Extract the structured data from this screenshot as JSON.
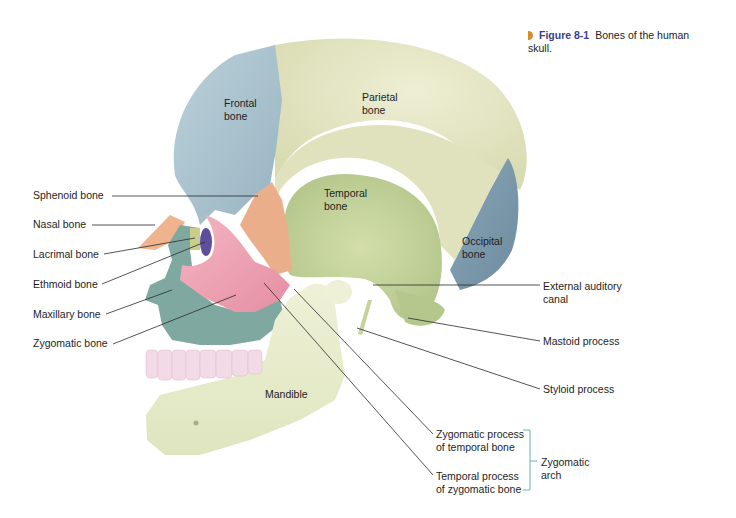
{
  "caption": {
    "figure_number": "Figure 8-1",
    "title_line1": "Bones of the human",
    "title_line2": "skull."
  },
  "colors": {
    "frontal": "#a9c3cf",
    "parietal": "#e4e5c4",
    "temporal": "#c9d7a0",
    "occipital": "#7f9cae",
    "sphenoid": "#eab08e",
    "nasal": "#efb48e",
    "zygomatic": "#ee9fb0",
    "maxillary": "#7fa9a0",
    "mandible": "#e7eccb",
    "teeth": "#f2dbe6",
    "lacrimal": "#c9cf8a",
    "ethmoid": "#6a5aa8",
    "caption_accent": "#d98a2b",
    "caption_text": "#3a3f8f"
  },
  "labels": {
    "frontal": [
      "Frontal",
      "bone"
    ],
    "parietal": [
      "Parietal",
      "bone"
    ],
    "temporal": [
      "Temporal",
      "bone"
    ],
    "occipital": [
      "Occipital",
      "bone"
    ],
    "mandible": "Mandible",
    "sphenoid": "Sphenoid bone",
    "nasal": "Nasal bone",
    "lacrimal": "Lacrimal bone",
    "ethmoid": "Ethmoid bone",
    "maxillary": "Maxillary bone",
    "zygomatic": "Zygomatic bone",
    "external_auditory": [
      "External auditory",
      "canal"
    ],
    "mastoid": "Mastoid process",
    "styloid": "Styloid process",
    "zyg_process_temporal": [
      "Zygomatic process",
      "of temporal bone"
    ],
    "temp_process_zygomatic": [
      "Temporal process",
      "of zygomatic bone"
    ],
    "zygomatic_arch": [
      "Zygomatic",
      "arch"
    ]
  }
}
